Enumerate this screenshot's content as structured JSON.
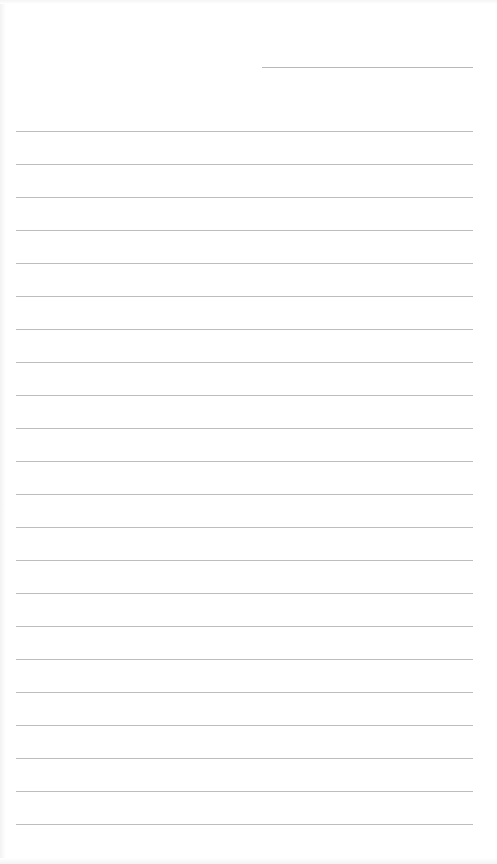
{
  "page": {
    "type": "blank lined paper",
    "background_color": "#ffffff",
    "line_color": "#bdbdbd",
    "header_line": {
      "label": ""
    },
    "ruled_line_count": 22
  }
}
